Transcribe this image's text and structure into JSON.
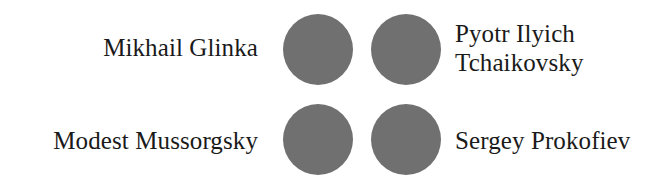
{
  "exercise": {
    "type": "matching-pairs",
    "background_color": "#ffffff",
    "text_color": "#1a1a1a",
    "marker_color": "#707070",
    "rows": [
      {
        "left_label": "Mikhail Glinka",
        "left_marker": "circle-marker",
        "right_marker": "circle-marker",
        "right_label": "Pyotr Ilyich Tchaikovsky"
      },
      {
        "left_label": "Modest Mussorgsky",
        "left_marker": "circle-marker",
        "right_marker": "circle-marker",
        "right_label": "Sergey Prokofiev"
      }
    ]
  }
}
